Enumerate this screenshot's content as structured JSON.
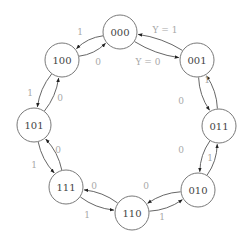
{
  "diagram": {
    "type": "state-transition-diagram",
    "nodes": [
      {
        "id": "000",
        "label": "000",
        "x": 120,
        "y": 32
      },
      {
        "id": "001",
        "label": "001",
        "x": 197,
        "y": 60
      },
      {
        "id": "011",
        "label": "011",
        "x": 219,
        "y": 126
      },
      {
        "id": "010",
        "label": "010",
        "x": 198,
        "y": 190
      },
      {
        "id": "110",
        "label": "110",
        "x": 132,
        "y": 213
      },
      {
        "id": "111",
        "label": "111",
        "x": 66,
        "y": 187
      },
      {
        "id": "101",
        "label": "101",
        "x": 34,
        "y": 125
      },
      {
        "id": "100",
        "label": "100",
        "x": 62,
        "y": 60
      }
    ],
    "edges": [
      {
        "from": "000",
        "to": "001",
        "label": "Y = 1",
        "lx": 165,
        "ly": 30
      },
      {
        "from": "001",
        "to": "000",
        "label": "Y = 0",
        "lx": 148,
        "ly": 62
      },
      {
        "from": "001",
        "to": "011",
        "label": "1",
        "lx": 207,
        "ly": 80
      },
      {
        "from": "011",
        "to": "001",
        "label": "0",
        "lx": 181,
        "ly": 101
      },
      {
        "from": "011",
        "to": "010",
        "label": "1",
        "lx": 210,
        "ly": 158
      },
      {
        "from": "010",
        "to": "011",
        "label": "0",
        "lx": 181,
        "ly": 150
      },
      {
        "from": "010",
        "to": "110",
        "label": "1",
        "lx": 162,
        "ly": 217
      },
      {
        "from": "110",
        "to": "010",
        "label": "0",
        "lx": 146,
        "ly": 186
      },
      {
        "from": "110",
        "to": "111",
        "label": "1",
        "lx": 87,
        "ly": 215
      },
      {
        "from": "111",
        "to": "110",
        "label": "0",
        "lx": 94,
        "ly": 186
      },
      {
        "from": "111",
        "to": "101",
        "label": "1",
        "lx": 34,
        "ly": 165
      },
      {
        "from": "101",
        "to": "111",
        "label": "0",
        "lx": 58,
        "ly": 150
      },
      {
        "from": "101",
        "to": "100",
        "label": "1",
        "lx": 30,
        "ly": 93
      },
      {
        "from": "100",
        "to": "101",
        "label": "0",
        "lx": 60,
        "ly": 98
      },
      {
        "from": "100",
        "to": "000",
        "label": "1",
        "lx": 80,
        "ly": 32
      },
      {
        "from": "000",
        "to": "100",
        "label": "0",
        "lx": 98,
        "ly": 62
      }
    ],
    "colors": {
      "node_stroke": "#6a6a6a",
      "node_text": "#444444",
      "edge_stroke": "#555555",
      "edge_label": "#a8a8a8"
    }
  }
}
